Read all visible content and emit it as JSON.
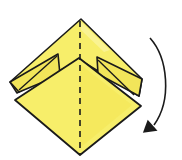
{
  "diagram": {
    "type": "origami-step",
    "colors": {
      "paper": "#f7ee6a",
      "paper_light": "#fbf5a4",
      "paper_shade": "#e9dc3c",
      "line": "#1a1a1a",
      "background": "#ffffff"
    },
    "elements": {
      "center_crease": "dashed valley line",
      "arrow": "curved arrow clockwise downward"
    }
  }
}
